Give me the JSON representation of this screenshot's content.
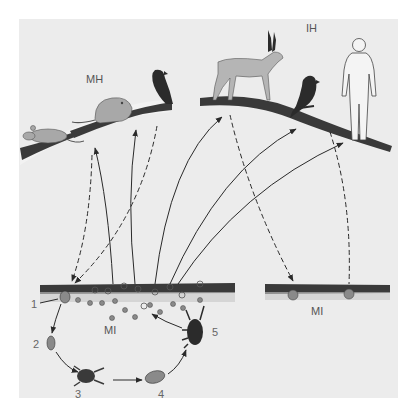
{
  "figure": {
    "type": "parasite life cycle diagram",
    "labels": {
      "definitive_hosts_group_a": "MH",
      "definitive_hosts_group_b": "IH",
      "soil_left": "MI",
      "soil_right": "MI"
    },
    "stages": [
      {
        "number": "1",
        "name": "stage-1-egg-in-soil"
      },
      {
        "number": "2",
        "name": "stage-2-egg"
      },
      {
        "number": "3",
        "name": "stage-3-mite"
      },
      {
        "number": "4",
        "name": "stage-4-egg"
      },
      {
        "number": "5",
        "name": "stage-5-mite-adult"
      }
    ],
    "hosts_left": [
      "mouse",
      "rat",
      "bird"
    ],
    "hosts_right": [
      "antelope",
      "bird",
      "human"
    ],
    "colors": {
      "background": "#ececec",
      "border": "#ffffff",
      "ink": "#2a2a2a",
      "animal_gray": "#a8a8a8",
      "bird_dark": "#2b2b2b",
      "label": "#555555"
    }
  }
}
